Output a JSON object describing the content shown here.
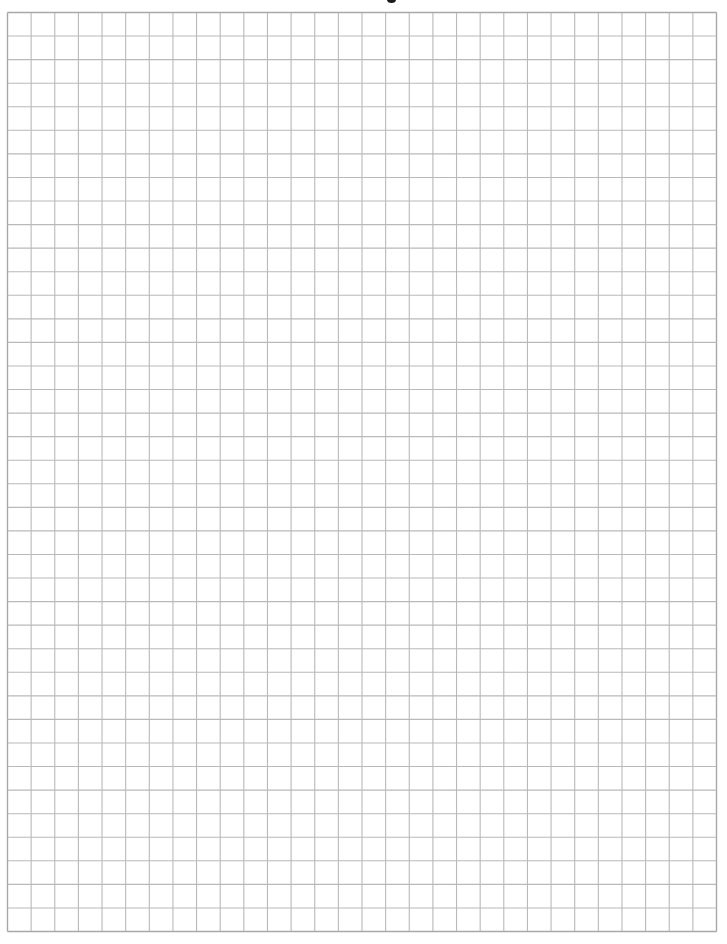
{
  "document": {
    "type": "graph paper",
    "grid": {
      "columns": 30,
      "rows": 39,
      "line_color": "#b9b9b9",
      "border_color": "#a8a8a8",
      "background_color": "#ffffff"
    },
    "content": ""
  }
}
